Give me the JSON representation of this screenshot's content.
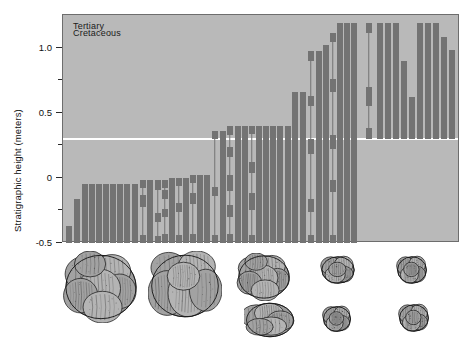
{
  "figure": {
    "title": "",
    "background_color": "#ffffff",
    "plot_background_color": "#b9b9b9",
    "bar_color": "#737373",
    "boundary_line_color": "#ffffff",
    "axis_color": "#2b2b2b"
  },
  "axis": {
    "y_title": "Stratigraphic height (meters)",
    "major_ticks": [
      {
        "label": "1.0",
        "value": 1.0
      },
      {
        "label": "0.5",
        "value": 0.5
      },
      {
        "label": "0",
        "value": 0.0
      },
      {
        "label": "-0.5",
        "value": -0.5
      }
    ],
    "minor_tick_values": [
      0.75,
      0.25,
      -0.25
    ],
    "y_min": -0.5,
    "y_max": 1.25
  },
  "epochs": {
    "upper_label": "Tertiary",
    "lower_label": "Cretaceous",
    "boundary_value": 0.3
  },
  "chart_data": {
    "type": "bar",
    "title": "",
    "xlabel": "",
    "ylabel": "Stratigraphic height (meters)",
    "ylim": [
      -0.5,
      1.25
    ],
    "grid": false,
    "legend": "none",
    "annotations": [
      "Tertiary",
      "Cretaceous"
    ],
    "boundary_line_y": 0.3,
    "categories": [
      "s1",
      "s2",
      "s3",
      "s4",
      "s5",
      "s6",
      "s7",
      "s8",
      "s9",
      "s10",
      "s11",
      "s12",
      "s13",
      "s14",
      "s15",
      "s16",
      "s17",
      "s18",
      "s19",
      "s20",
      "s21",
      "s22",
      "s23",
      "s24",
      "s25",
      "s26",
      "s27",
      "s28",
      "s29",
      "s30",
      "s31",
      "s32",
      "s33",
      "s34",
      "s35",
      "s36",
      "s37",
      "s38",
      "s39",
      "s40",
      "s41",
      "s42",
      "s43",
      "s44",
      "s45",
      "s46",
      "s47",
      "s48",
      "s49",
      "s50",
      "s51",
      "s52",
      "s53",
      "s54",
      "s55",
      "s56",
      "s57",
      "s58",
      "s59",
      "s60",
      "s61",
      "s62",
      "s63",
      "s64",
      "s65",
      "s66",
      "s67",
      "s68",
      "s69",
      "s70",
      "s71",
      "s72",
      "s73",
      "s74",
      "s75",
      "s76",
      "s77"
    ],
    "ranges": [
      {
        "x": 68,
        "bottom": -0.5,
        "top": -0.37,
        "style": "solid"
      },
      {
        "x": 76,
        "bottom": -0.5,
        "top": -0.16,
        "style": "solid"
      },
      {
        "x": 84,
        "bottom": -0.5,
        "top": -0.05,
        "style": "solid"
      },
      {
        "x": 91,
        "bottom": -0.5,
        "top": -0.05,
        "style": "solid"
      },
      {
        "x": 98,
        "bottom": -0.5,
        "top": -0.05,
        "style": "solid"
      },
      {
        "x": 105,
        "bottom": -0.5,
        "top": -0.05,
        "style": "solid"
      },
      {
        "x": 112,
        "bottom": -0.5,
        "top": -0.05,
        "style": "solid"
      },
      {
        "x": 119,
        "bottom": -0.5,
        "top": -0.05,
        "style": "solid"
      },
      {
        "x": 126,
        "bottom": -0.5,
        "top": -0.05,
        "style": "solid"
      },
      {
        "x": 134,
        "bottom": -0.5,
        "top": -0.05,
        "style": "solid"
      },
      {
        "x": 142,
        "bottom": -0.5,
        "top": -0.02,
        "style": "dotted",
        "blocks": [
          [
            -0.5,
            -0.44
          ],
          [
            -0.22,
            -0.13
          ],
          [
            -0.08,
            -0.02
          ]
        ]
      },
      {
        "x": 149,
        "bottom": -0.5,
        "top": -0.02,
        "style": "solid"
      },
      {
        "x": 157,
        "bottom": -0.5,
        "top": -0.02,
        "style": "dotted",
        "blocks": [
          [
            -0.5,
            -0.45
          ],
          [
            -0.34,
            -0.27
          ],
          [
            -0.09,
            -0.02
          ]
        ]
      },
      {
        "x": 164,
        "bottom": -0.5,
        "top": -0.02,
        "style": "dotted",
        "blocks": [
          [
            -0.5,
            -0.43
          ],
          [
            -0.3,
            -0.24
          ],
          [
            -0.16,
            -0.09
          ],
          [
            -0.08,
            -0.02
          ]
        ]
      },
      {
        "x": 171,
        "bottom": -0.5,
        "top": 0.0,
        "style": "solid"
      },
      {
        "x": 178,
        "bottom": -0.5,
        "top": 0.0,
        "style": "dotted",
        "blocks": [
          [
            -0.5,
            -0.44
          ],
          [
            -0.26,
            -0.19
          ],
          [
            -0.06,
            0.0
          ]
        ]
      },
      {
        "x": 185,
        "bottom": -0.5,
        "top": 0.0,
        "style": "solid"
      },
      {
        "x": 192,
        "bottom": -0.5,
        "top": 0.02,
        "style": "dotted",
        "blocks": [
          [
            -0.5,
            -0.43
          ],
          [
            -0.2,
            -0.12
          ],
          [
            -0.04,
            0.02
          ]
        ]
      },
      {
        "x": 199,
        "bottom": -0.5,
        "top": 0.02,
        "style": "solid"
      },
      {
        "x": 206,
        "bottom": -0.5,
        "top": 0.02,
        "style": "solid"
      },
      {
        "x": 214,
        "bottom": -0.5,
        "top": 0.36,
        "style": "dotted",
        "blocks": [
          [
            -0.5,
            -0.44
          ],
          [
            -0.14,
            -0.07
          ],
          [
            0.3,
            0.36
          ]
        ]
      },
      {
        "x": 222,
        "bottom": -0.5,
        "top": 0.36,
        "style": "solid"
      },
      {
        "x": 229,
        "bottom": -0.5,
        "top": 0.4,
        "style": "dotted",
        "blocks": [
          [
            -0.5,
            -0.43
          ],
          [
            -0.3,
            -0.21
          ],
          [
            -0.1,
            0.02
          ],
          [
            0.16,
            0.24
          ],
          [
            0.33,
            0.4
          ]
        ]
      },
      {
        "x": 237,
        "bottom": -0.5,
        "top": 0.4,
        "style": "solid"
      },
      {
        "x": 244,
        "bottom": -0.5,
        "top": 0.4,
        "style": "solid"
      },
      {
        "x": 251,
        "bottom": -0.5,
        "top": 0.4,
        "style": "dotted",
        "blocks": [
          [
            -0.5,
            -0.44
          ],
          [
            -0.25,
            -0.12
          ],
          [
            0.04,
            0.12
          ],
          [
            0.34,
            0.4
          ]
        ]
      },
      {
        "x": 258,
        "bottom": -0.5,
        "top": 0.4,
        "style": "solid"
      },
      {
        "x": 265,
        "bottom": -0.5,
        "top": 0.4,
        "style": "solid"
      },
      {
        "x": 272,
        "bottom": -0.5,
        "top": 0.4,
        "style": "solid"
      },
      {
        "x": 279,
        "bottom": -0.5,
        "top": 0.4,
        "style": "solid"
      },
      {
        "x": 287,
        "bottom": -0.5,
        "top": 0.4,
        "style": "solid"
      },
      {
        "x": 294,
        "bottom": -0.5,
        "top": 0.66,
        "style": "solid"
      },
      {
        "x": 302,
        "bottom": -0.5,
        "top": 0.66,
        "style": "solid"
      },
      {
        "x": 310,
        "bottom": -0.5,
        "top": 0.97,
        "style": "dotted",
        "blocks": [
          [
            -0.5,
            -0.44
          ],
          [
            -0.26,
            -0.16
          ],
          [
            0.18,
            0.3
          ],
          [
            0.55,
            0.63
          ],
          [
            0.9,
            0.97
          ]
        ]
      },
      {
        "x": 318,
        "bottom": -0.5,
        "top": 0.97,
        "style": "solid"
      },
      {
        "x": 325,
        "bottom": -0.5,
        "top": 1.02,
        "style": "solid"
      },
      {
        "x": 332,
        "bottom": -0.5,
        "top": 1.11,
        "style": "dotted",
        "blocks": [
          [
            -0.5,
            -0.44
          ],
          [
            -0.11,
            -0.02
          ],
          [
            0.22,
            0.33
          ],
          [
            0.66,
            0.76
          ],
          [
            1.04,
            1.11
          ]
        ]
      },
      {
        "x": 339,
        "bottom": -0.5,
        "top": 1.19,
        "style": "solid"
      },
      {
        "x": 346,
        "bottom": -0.5,
        "top": 1.19,
        "style": "solid"
      },
      {
        "x": 353,
        "bottom": -0.5,
        "top": 1.19,
        "style": "solid"
      },
      {
        "x": 368,
        "bottom": 0.3,
        "top": 1.19,
        "style": "dotted",
        "blocks": [
          [
            0.3,
            0.38
          ],
          [
            0.55,
            0.7
          ],
          [
            1.11,
            1.19
          ]
        ]
      },
      {
        "x": 379,
        "bottom": 0.3,
        "top": 1.19,
        "style": "solid"
      },
      {
        "x": 387,
        "bottom": 0.3,
        "top": 1.19,
        "style": "solid"
      },
      {
        "x": 395,
        "bottom": 0.3,
        "top": 1.19,
        "style": "solid"
      },
      {
        "x": 403,
        "bottom": 0.3,
        "top": 0.9,
        "style": "solid"
      },
      {
        "x": 411,
        "bottom": 0.3,
        "top": 0.62,
        "style": "solid"
      },
      {
        "x": 419,
        "bottom": 0.3,
        "top": 1.19,
        "style": "solid"
      },
      {
        "x": 427,
        "bottom": 0.3,
        "top": 1.19,
        "style": "solid"
      },
      {
        "x": 435,
        "bottom": 0.3,
        "top": 1.19,
        "style": "solid"
      },
      {
        "x": 443,
        "bottom": 0.3,
        "top": 1.08,
        "style": "solid"
      },
      {
        "x": 451,
        "bottom": 0.3,
        "top": 0.98,
        "style": "solid"
      }
    ]
  },
  "fossils": [
    {
      "name": "fossil-globotruncana-large",
      "x": 62,
      "y": 8,
      "w": 78,
      "h": 72,
      "shape": "lobate-cluster"
    },
    {
      "name": "fossil-globotruncana-ventral",
      "x": 148,
      "y": 8,
      "w": 74,
      "h": 70,
      "shape": "ribbed-sphere"
    },
    {
      "name": "fossil-heterohelix-medium",
      "x": 236,
      "y": 10,
      "w": 56,
      "h": 48,
      "shape": "lobate-cluster"
    },
    {
      "name": "fossil-rugoglobigerina-small",
      "x": 320,
      "y": 12,
      "w": 36,
      "h": 30,
      "shape": "small-cluster"
    },
    {
      "name": "fossil-hedbergella-small",
      "x": 396,
      "y": 12,
      "w": 32,
      "h": 30,
      "shape": "small-cluster"
    },
    {
      "name": "fossil-spiral-elongate",
      "x": 244,
      "y": 58,
      "w": 52,
      "h": 38,
      "shape": "spiral-elongate"
    },
    {
      "name": "fossil-guembelitria-tiny-left",
      "x": 322,
      "y": 62,
      "w": 30,
      "h": 28,
      "shape": "small-cluster"
    },
    {
      "name": "fossil-guembelitria-tiny-right",
      "x": 398,
      "y": 60,
      "w": 32,
      "h": 30,
      "shape": "small-cluster"
    }
  ]
}
